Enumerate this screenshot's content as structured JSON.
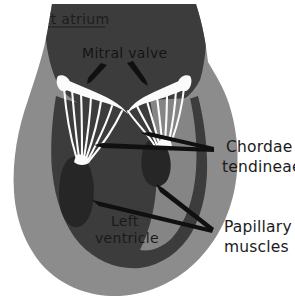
{
  "figure": {
    "background_color": "#ffffff"
  },
  "palette": {
    "myocardium_wall": "#8c8c8c",
    "chamber_dark": "#3c3c3c",
    "papillary_muscle": "#262626",
    "valve_white": "#fbfbfb",
    "arrow_black": "#101010",
    "label_text": "#1b1b1b"
  },
  "labels": {
    "left_atrium": "Left atrium",
    "mitral_valve": "Mitral valve",
    "left_ventricle_line1": "Left",
    "left_ventricle_line2": "ventricle",
    "chordae_line1": "Chordae",
    "chordae_line2": "tendineae",
    "papillary_line1": "Papillary",
    "papillary_line2": "muscles"
  },
  "structures": [
    {
      "name": "left-atrium",
      "label": "Left atrium",
      "region": "upper chamber"
    },
    {
      "name": "mitral-valve",
      "label": "Mitral valve",
      "region": "between atrium and ventricle"
    },
    {
      "name": "chordae-tendineae",
      "label": "Chordae tendineae",
      "region": "strands from leaflets to papillary muscles"
    },
    {
      "name": "papillary-muscles",
      "label": "Papillary muscles",
      "region": "ventricle wall projections"
    },
    {
      "name": "left-ventricle",
      "label": "Left ventricle",
      "region": "lower chamber"
    }
  ]
}
